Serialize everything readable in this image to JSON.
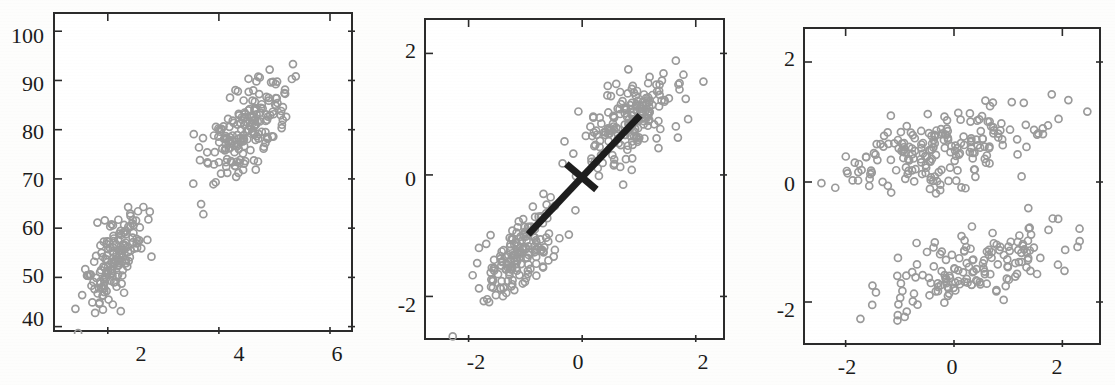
{
  "figure": {
    "background_color": "#fdfdfc",
    "marker_color": "#9a9a9a",
    "axis_color": "#2b2b2b",
    "line_color": "#1d1d1d",
    "panel_count": 3
  },
  "chart_data": [
    {
      "type": "scatter",
      "id": "panel-raw-data",
      "title": "",
      "xlabel": "",
      "ylabel": "",
      "xlim": [
        1.05,
        6.45
      ],
      "ylim": [
        38.5,
        103.5
      ],
      "xticks": [
        2,
        4,
        6
      ],
      "xticklabels": [
        "2",
        "4",
        "6"
      ],
      "yticks": [
        40,
        50,
        60,
        70,
        80,
        90,
        100
      ],
      "yticklabels": [
        "40",
        "50",
        "60",
        "70",
        "80",
        "90",
        "100"
      ],
      "grid": false,
      "legend": null,
      "marker": "open-circle",
      "clusters": [
        {
          "name": "low-cluster",
          "n": 160,
          "x_mean": 2.1,
          "y_mean": 53.5,
          "x_sd": 0.26,
          "y_sd": 5.4,
          "corr": 0.62
        },
        {
          "name": "high-cluster",
          "n": 185,
          "x_mean": 4.45,
          "y_mean": 79.5,
          "x_sd": 0.42,
          "y_sd": 5.8,
          "corr": 0.62
        }
      ],
      "annotations": []
    },
    {
      "type": "scatter",
      "id": "panel-standardized-with-pc1",
      "title": "",
      "xlabel": "",
      "ylabel": "",
      "xlim": [
        -2.75,
        2.55
      ],
      "ylim": [
        -2.75,
        2.55
      ],
      "xticks": [
        -2,
        0,
        2
      ],
      "xticklabels": [
        "-2",
        "0",
        "2"
      ],
      "yticks": [
        -2,
        0,
        2
      ],
      "yticklabels": [
        "-2",
        "0",
        "2"
      ],
      "grid": false,
      "legend": null,
      "marker": "open-circle",
      "clusters": [
        {
          "name": "low-cluster",
          "n": 160,
          "x_mean": -1.08,
          "y_mean": -1.24,
          "x_sd": 0.33,
          "y_sd": 0.36,
          "corr": 0.62
        },
        {
          "name": "high-cluster",
          "n": 185,
          "x_mean": 0.82,
          "y_mean": 0.88,
          "x_sd": 0.42,
          "y_sd": 0.42,
          "corr": 0.62
        }
      ],
      "annotations": [
        {
          "name": "pc1-axis-line",
          "type": "line",
          "x1": -0.95,
          "y1": -0.98,
          "x2": 1.02,
          "y2": 0.98,
          "width_px": 7
        },
        {
          "name": "pc2-axis-tick",
          "type": "line",
          "x1": -0.28,
          "y1": 0.18,
          "x2": 0.25,
          "y2": -0.24,
          "width_px": 7
        }
      ]
    },
    {
      "type": "scatter",
      "id": "panel-pca-rotated",
      "title": "",
      "xlabel": "",
      "ylabel": "",
      "xlim": [
        -2.75,
        2.75
      ],
      "ylim": [
        -2.75,
        2.55
      ],
      "xticks": [
        -2,
        0,
        2
      ],
      "xticklabels": [
        "-2",
        "0",
        "2"
      ],
      "yticks": [
        -2,
        0,
        2
      ],
      "yticklabels": [
        "-2",
        "0",
        "2"
      ],
      "grid": false,
      "legend": null,
      "marker": "open-circle",
      "clusters": [
        {
          "name": "upper-band",
          "n": 200,
          "x_mean": -0.15,
          "y_mean": 0.55,
          "x_sd": 0.88,
          "y_sd": 0.36,
          "corr": 0.55
        },
        {
          "name": "lower-band",
          "n": 150,
          "x_mean": 0.42,
          "y_mean": -1.38,
          "x_sd": 0.82,
          "y_sd": 0.38,
          "corr": 0.62
        }
      ],
      "annotations": []
    }
  ],
  "panels": [
    {
      "name": "raw-data",
      "frame": {
        "left": 53,
        "top": 12,
        "width": 300,
        "height": 320
      },
      "yticklabels": [
        "100",
        "90",
        "80",
        "70",
        "60",
        "50",
        "40"
      ],
      "ytick_y": [
        37,
        85,
        133,
        181,
        229,
        277,
        320
      ],
      "xticklabels": [
        "2",
        "4",
        "6"
      ],
      "xtick_x": [
        141,
        239,
        337
      ]
    },
    {
      "name": "standardized-with-pc1",
      "frame": {
        "left": 424,
        "top": 18,
        "width": 301,
        "height": 322
      },
      "yticklabels": [
        "2",
        "0",
        "2"
      ],
      "ytick_y": [
        52,
        180,
        306
      ],
      "xticklabels": [
        "-2",
        "0",
        "2"
      ],
      "xtick_x": [
        476,
        578,
        703
      ]
    },
    {
      "name": "pca-rotated",
      "frame": {
        "left": 803,
        "top": 27,
        "width": 298,
        "height": 318
      },
      "yticklabels": [
        "2",
        "0",
        "2"
      ],
      "ytick_y": [
        60,
        185,
        311
      ],
      "xticklabels": [
        "-2",
        "0",
        "2"
      ],
      "xtick_x": [
        847,
        952,
        1057
      ]
    }
  ]
}
